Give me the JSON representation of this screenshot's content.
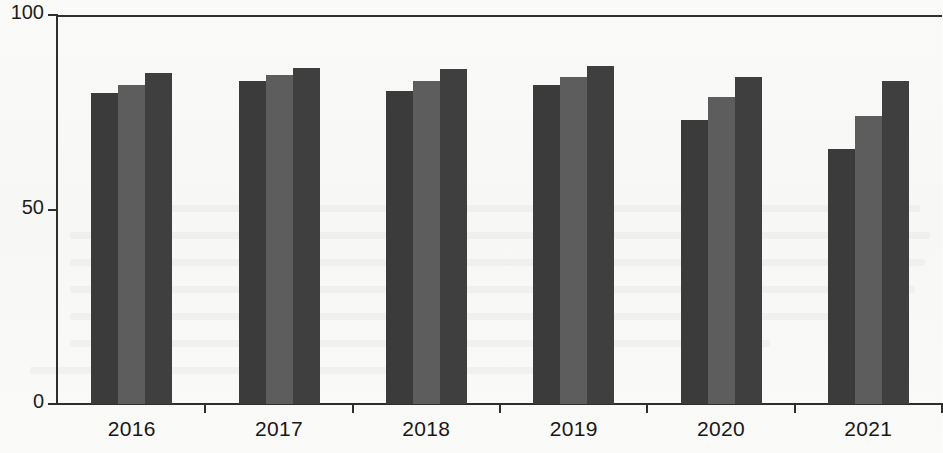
{
  "chart_data": {
    "type": "bar",
    "title": "",
    "subtitle": "",
    "xlabel": "",
    "ylabel": "",
    "categories": [
      "2016",
      "2017",
      "2018",
      "2019",
      "2020",
      "2021"
    ],
    "yticks": [
      "0",
      "50",
      "100"
    ],
    "ytick_values": [
      0,
      50,
      100
    ],
    "ylim": [
      0,
      100
    ],
    "grid": false,
    "legend": "none",
    "series": [
      {
        "name": "series-1",
        "color": "#3b3b3b",
        "values": [
          80,
          83,
          80.5,
          82,
          73,
          65.5
        ]
      },
      {
        "name": "series-2",
        "color": "#5d5d5d",
        "values": [
          82,
          84.5,
          83,
          84,
          79,
          74
        ]
      },
      {
        "name": "series-3",
        "color": "#3f3f3f",
        "values": [
          85,
          86.5,
          86,
          87,
          84,
          83
        ]
      }
    ]
  },
  "axes": {
    "y_axis_name": "y-axis",
    "x_axis_name": "x-axis",
    "top_rule_name": "top-rule"
  },
  "colors": {
    "axis": "#2e2e2e",
    "background": "#fbfbfa",
    "series_dark": "#3b3b3b",
    "series_mid": "#5d5d5d",
    "series_dark2": "#3f3f3f"
  }
}
